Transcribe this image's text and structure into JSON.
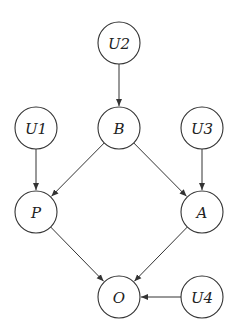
{
  "diagram": {
    "type": "causal-dag",
    "nodes": [
      {
        "id": "U2",
        "label": "U2",
        "x": 119,
        "y": 43
      },
      {
        "id": "U1",
        "label": "U1",
        "x": 36,
        "y": 128
      },
      {
        "id": "B",
        "label": "B",
        "x": 119,
        "y": 128
      },
      {
        "id": "U3",
        "label": "U3",
        "x": 202,
        "y": 128
      },
      {
        "id": "P",
        "label": "P",
        "x": 36,
        "y": 212
      },
      {
        "id": "A",
        "label": "A",
        "x": 202,
        "y": 212
      },
      {
        "id": "O",
        "label": "O",
        "x": 119,
        "y": 297
      },
      {
        "id": "U4",
        "label": "U4",
        "x": 202,
        "y": 297
      }
    ],
    "edges": [
      {
        "from": "U2",
        "to": "B"
      },
      {
        "from": "U1",
        "to": "P"
      },
      {
        "from": "B",
        "to": "P"
      },
      {
        "from": "B",
        "to": "A"
      },
      {
        "from": "U3",
        "to": "A"
      },
      {
        "from": "P",
        "to": "O"
      },
      {
        "from": "A",
        "to": "O"
      },
      {
        "from": "U4",
        "to": "O"
      }
    ],
    "node_radius": 21,
    "stroke_color": "#333333",
    "background": "#ffffff"
  }
}
